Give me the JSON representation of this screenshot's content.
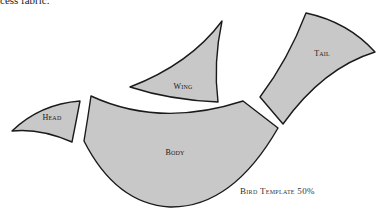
{
  "intro": {
    "text": "cess fabric."
  },
  "pieces": {
    "head": {
      "label": "Head"
    },
    "wing": {
      "label": "Wing"
    },
    "tail": {
      "label": "Tail"
    },
    "body": {
      "label": "Body"
    }
  },
  "caption": {
    "text": "Bird Template 50%"
  },
  "colors": {
    "fill": "#c8c8c8",
    "stroke": "#1a1a1a",
    "background": "#ffffff"
  }
}
